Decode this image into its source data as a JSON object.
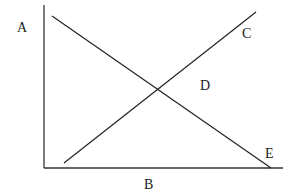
{
  "diagram": {
    "labels": {
      "A": "A",
      "B": "B",
      "C": "C",
      "D": "D",
      "E": "E"
    },
    "axes": {
      "vertical": {
        "x1": 44,
        "y1": 5,
        "x2": 44,
        "y2": 168
      },
      "horizontal": {
        "x1": 44,
        "y1": 168,
        "x2": 283,
        "y2": 168
      }
    },
    "lines": [
      {
        "name": "downward-line-A-to-E",
        "x1": 52,
        "y1": 16,
        "x2": 271,
        "y2": 168
      },
      {
        "name": "upward-line-to-C",
        "x1": 64,
        "y1": 163,
        "x2": 256,
        "y2": 12
      }
    ],
    "intersection_label": "D",
    "stroke_color": "#222222"
  }
}
